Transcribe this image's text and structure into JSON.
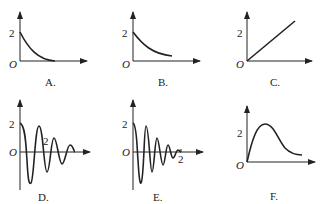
{
  "panels": [
    {
      "id": "A",
      "caption": "A.",
      "y_tick": "2",
      "origin": "O",
      "shape": "exponential decay reaching zero"
    },
    {
      "id": "B",
      "caption": "B.",
      "y_tick": "2",
      "origin": "O",
      "shape": "exponential decay not reaching zero"
    },
    {
      "id": "C",
      "caption": "C.",
      "y_tick": "2",
      "origin": "O",
      "shape": "straight line through origin"
    },
    {
      "id": "D",
      "caption": "D.",
      "y_tick": "2",
      "origin": "O",
      "mid_label": "2",
      "shape": "damped oscillation, slower frequency"
    },
    {
      "id": "E",
      "caption": "E.",
      "y_tick": "2",
      "origin": "O",
      "x_tick": "2",
      "shape": "damped oscillation, faster frequency"
    },
    {
      "id": "F",
      "caption": "F.",
      "y_tick": "2",
      "origin": "O",
      "shape": "rise to peak then decay"
    }
  ],
  "colors": {
    "ink": "#222222",
    "background": "#ffffff"
  }
}
